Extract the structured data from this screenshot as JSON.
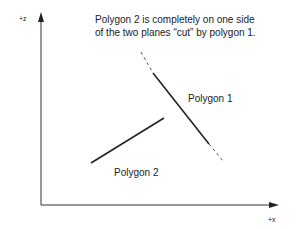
{
  "diagram": {
    "caption_line1": "Polygon 2 is completely on one side",
    "caption_line2": "of the two planes “cut” by polygon 1.",
    "polygon1_label": "Polygon 1",
    "polygon2_label": "Polygon 2",
    "z_axis_label": "+z",
    "x_axis_label": "+x"
  },
  "colors": {
    "ink": "#222222",
    "dash": "#555555"
  }
}
